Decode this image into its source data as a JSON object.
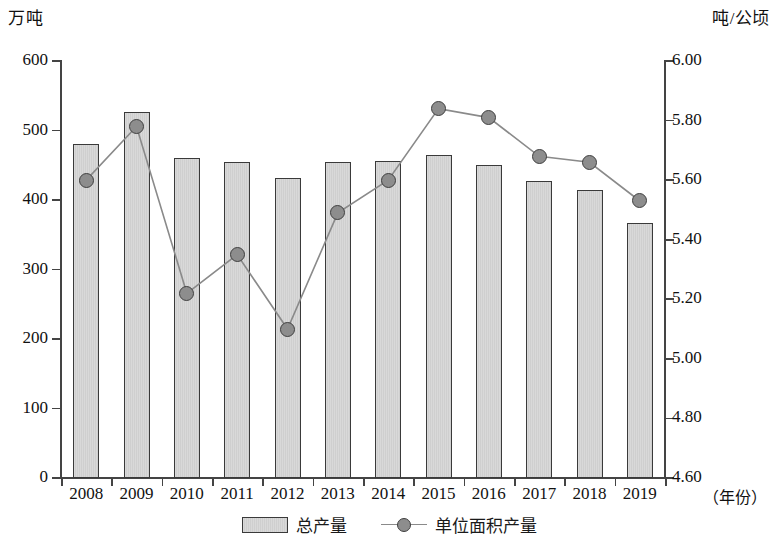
{
  "axes": {
    "left_unit": "万吨",
    "right_unit": "吨/公顷",
    "x_title": "（年份）",
    "left_ticks": [
      "600",
      "500",
      "400",
      "300",
      "200",
      "100",
      "0"
    ],
    "right_ticks": [
      "6.00",
      "5.80",
      "5.60",
      "5.40",
      "5.20",
      "5.00",
      "4.80",
      "4.60"
    ]
  },
  "legend": {
    "bar_label": "总产量",
    "line_label": "单位面积产量"
  },
  "chart_data": {
    "type": "bar",
    "title": "",
    "subtitle": "",
    "xlabel": "（年份）",
    "ylabel": "万吨",
    "y2label": "吨/公顷",
    "grid": false,
    "legend_position": "bottom",
    "categories": [
      "2008",
      "2009",
      "2010",
      "2011",
      "2012",
      "2013",
      "2014",
      "2015",
      "2016",
      "2017",
      "2018",
      "2019"
    ],
    "ylim": [
      0,
      600
    ],
    "y2lim": [
      4.6,
      6.0
    ],
    "yticks": [
      0,
      100,
      200,
      300,
      400,
      500,
      600
    ],
    "y2ticks": [
      4.6,
      4.8,
      5.0,
      5.2,
      5.4,
      5.6,
      5.8,
      6.0
    ],
    "series": [
      {
        "name": "总产量",
        "type": "bar",
        "axis": "left",
        "unit": "万吨",
        "values": [
          480,
          527,
          460,
          455,
          432,
          455,
          456,
          465,
          450,
          427,
          415,
          367
        ]
      },
      {
        "name": "单位面积产量",
        "type": "line",
        "axis": "right",
        "unit": "吨/公顷",
        "values": [
          5.6,
          5.78,
          5.22,
          5.35,
          5.1,
          5.49,
          5.6,
          5.84,
          5.81,
          5.68,
          5.66,
          5.53
        ]
      }
    ]
  }
}
